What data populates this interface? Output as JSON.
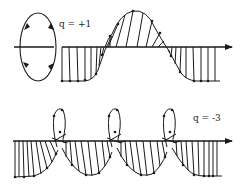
{
  "figure": {
    "top_panel": {
      "label": "q = +1",
      "charge": 1
    },
    "bottom_panel": {
      "label": "q = -3",
      "charge": -3
    },
    "colors": {
      "ink": "#1a1a1a",
      "background": "#ffffff"
    }
  }
}
